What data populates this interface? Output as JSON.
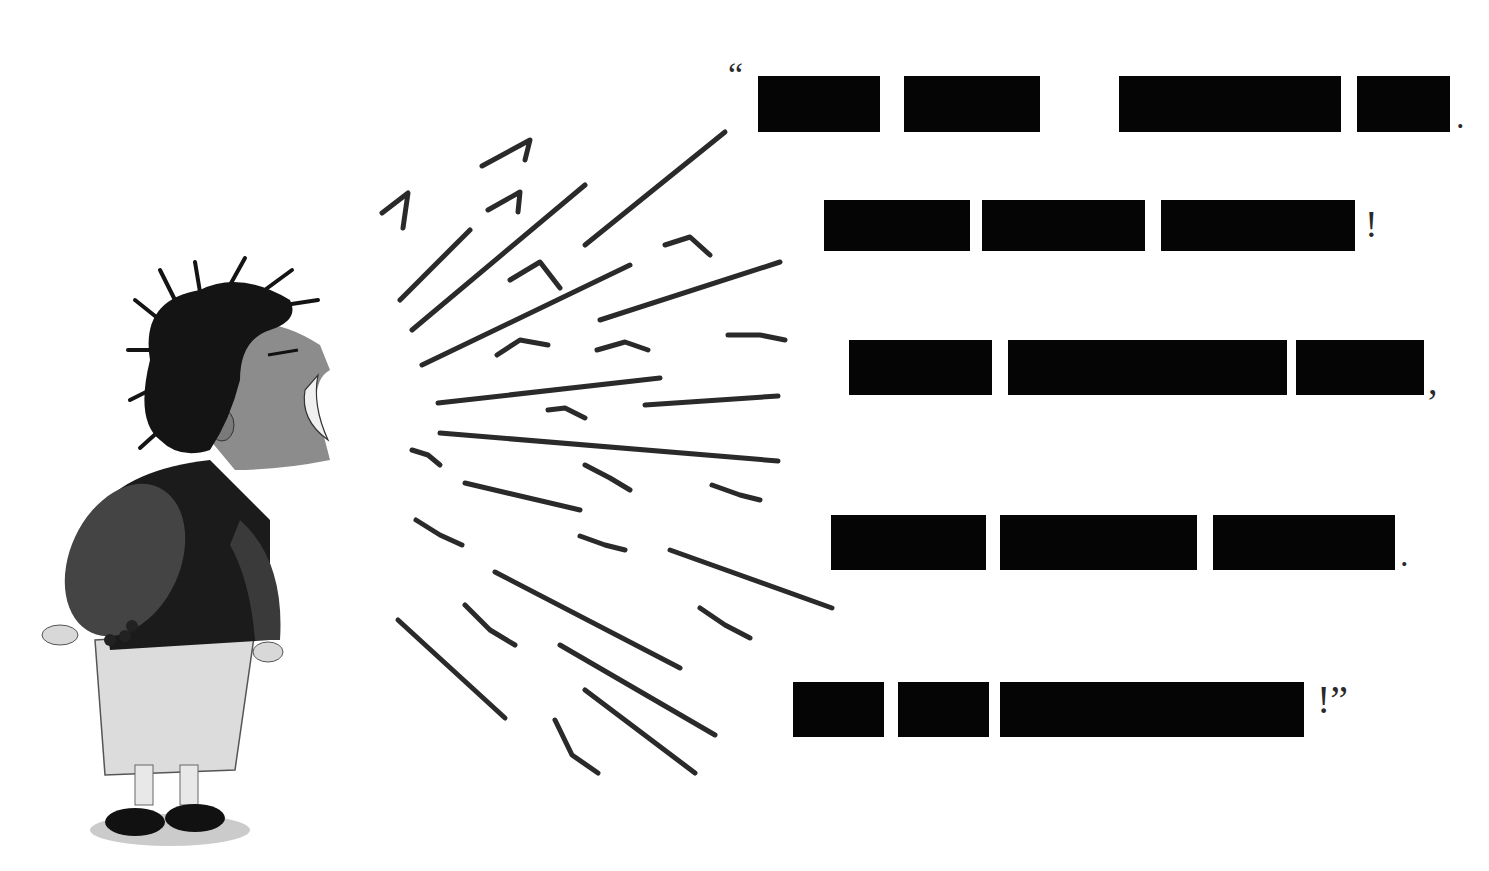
{
  "illustration": {
    "description": "Ink-and-wash drawing of a screaming child with motion lines emanating from the mouth",
    "colors": {
      "ink": "#1a1a1a",
      "skin": "#8c8c8c",
      "sweater": "#1e1e1e",
      "sleeve": "#3c3c3c",
      "skirt": "#d4d4d4",
      "shadow": "#9a9a9a"
    }
  },
  "quote": {
    "open_mark": "“",
    "lines": [
      {
        "bars": [
          [
            758,
            76,
            122,
            56
          ],
          [
            904,
            76,
            136,
            56
          ],
          [
            1119,
            76,
            222,
            56
          ],
          [
            1357,
            76,
            93,
            56
          ]
        ],
        "end": ".",
        "end_pos": [
          1456,
          100
        ],
        "size": 34
      },
      {
        "bars": [
          [
            824,
            200,
            146,
            51
          ],
          [
            982,
            200,
            163,
            51
          ],
          [
            1161,
            200,
            194,
            51
          ]
        ],
        "end": "!",
        "end_pos": [
          1365,
          205
        ],
        "size": 38
      },
      {
        "bars": [
          [
            849,
            340,
            143,
            55
          ],
          [
            1008,
            340,
            279,
            55
          ],
          [
            1296,
            340,
            128,
            55
          ]
        ],
        "end": ",",
        "end_pos": [
          1428,
          362
        ],
        "size": 38
      },
      {
        "bars": [
          [
            831,
            515,
            155,
            55
          ],
          [
            1000,
            515,
            197,
            55
          ],
          [
            1213,
            515,
            182,
            55
          ]
        ],
        "end": ".",
        "end_pos": [
          1400,
          538
        ],
        "size": 34
      },
      {
        "bars": [
          [
            793,
            682,
            91,
            55
          ],
          [
            898,
            682,
            91,
            55
          ],
          [
            1000,
            682,
            304,
            55
          ]
        ],
        "end": "!”",
        "end_pos": [
          1317,
          680
        ],
        "size": 40
      }
    ],
    "redacted": true
  }
}
